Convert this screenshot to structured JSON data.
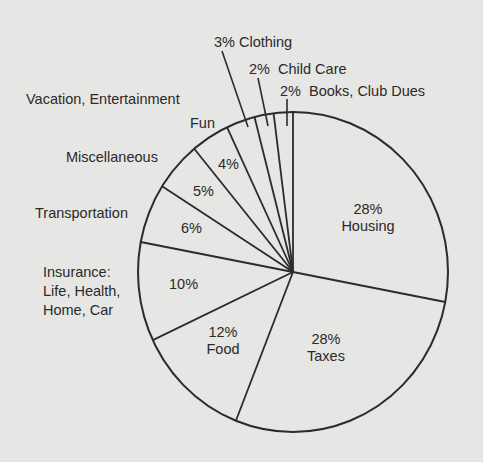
{
  "chart_data": {
    "type": "pie",
    "title": "",
    "start_angle_deg": -90,
    "direction": "clockwise",
    "categories": [
      "Housing",
      "Taxes",
      "Food",
      "Insurance: Life, Health, Home, Car",
      "Transportation",
      "Miscellaneous",
      "Vacation, Entertainment Fun",
      "Clothing",
      "Child Care",
      "Books, Club Dues"
    ],
    "values": [
      28,
      28,
      12,
      10,
      6,
      5,
      4,
      3,
      2,
      2
    ],
    "unit": "%",
    "colors": {
      "background": "#e6e6e4",
      "stroke": "#2b2b2b",
      "fill": "#e6e6e4"
    }
  },
  "labels": {
    "housing_pct": "28%",
    "housing": "Housing",
    "taxes_pct": "28%",
    "taxes": "Taxes",
    "food_pct": "12%",
    "food": "Food",
    "insurance_pct": "10%",
    "insurance_1": "Insurance:",
    "insurance_2": "Life, Health,",
    "insurance_3": "Home, Car",
    "transportation_pct": "6%",
    "transportation": "Transportation",
    "misc_pct": "5%",
    "misc": "Miscellaneous",
    "vacation_pct": "4%",
    "vacation_1": "Vacation, Entertainment",
    "vacation_2": "Fun",
    "clothing": "3% Clothing",
    "childcare_pct": "2%",
    "childcare": "Child Care",
    "books_pct": "2%",
    "books": "Books, Club Dues"
  }
}
